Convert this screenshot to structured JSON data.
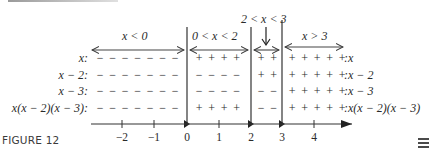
{
  "figure": {
    "caption": "FIGURE 12",
    "menu_icon": "hamburger-menu-icon"
  },
  "intervals": [
    {
      "label": "x < 0",
      "from": "-inf",
      "to": 0
    },
    {
      "label": "0 < x < 2",
      "from": 0,
      "to": 2
    },
    {
      "label": "2 < x < 3",
      "from": 2,
      "to": 3
    },
    {
      "label": "x > 3",
      "from": 3,
      "to": "inf"
    }
  ],
  "rows": [
    {
      "label_left": "x:",
      "label_right": ":x",
      "signs": [
        "-",
        "+",
        "+",
        "+"
      ]
    },
    {
      "label_left": "x − 2:",
      "label_right": ":x − 2",
      "signs": [
        "-",
        "-",
        "+",
        "+"
      ]
    },
    {
      "label_left": "x − 3:",
      "label_right": ":x − 3",
      "signs": [
        "-",
        "-",
        "-",
        "+"
      ]
    },
    {
      "label_left": "x(x − 2)(x − 3):",
      "label_right": ":x(x − 2)(x − 3)",
      "signs": [
        "-",
        "+",
        "-",
        "+"
      ]
    }
  ],
  "sign_strings": {
    "r0": {
      "a": "− − − − − − −",
      "b": "+ + + +",
      "c": "+ +",
      "d": "+ + + + +"
    },
    "r1": {
      "a": "− − − − − − −",
      "b": "− − − −",
      "c": "+ +",
      "d": "+ + + + +"
    },
    "r2": {
      "a": "− − − − − − −",
      "b": "− − − −",
      "c": "− −",
      "d": "+ + + + +"
    },
    "r3": {
      "a": "− − − − − − −",
      "b": "+ + + +",
      "c": "− −",
      "d": "+ + + + +"
    }
  },
  "number_line": {
    "ticks": [
      "−2",
      "−1",
      "0",
      "1",
      "2",
      "3",
      "4"
    ],
    "critical_points": [
      "0",
      "2",
      "3"
    ]
  },
  "chart_data": {
    "type": "table",
    "columns": [
      "x < 0",
      "0 < x < 2",
      "2 < x < 3",
      "x > 3"
    ],
    "rows": [
      {
        "factor": "x",
        "signs": [
          "-",
          "+",
          "+",
          "+"
        ]
      },
      {
        "factor": "x − 2",
        "signs": [
          "-",
          "-",
          "+",
          "+"
        ]
      },
      {
        "factor": "x − 3",
        "signs": [
          "-",
          "-",
          "-",
          "+"
        ]
      },
      {
        "factor": "x(x − 2)(x − 3)",
        "signs": [
          "-",
          "+",
          "-",
          "+"
        ]
      }
    ],
    "xticks": [
      -2,
      -1,
      0,
      1,
      2,
      3,
      4
    ],
    "critical_points": [
      0,
      2,
      3
    ]
  }
}
